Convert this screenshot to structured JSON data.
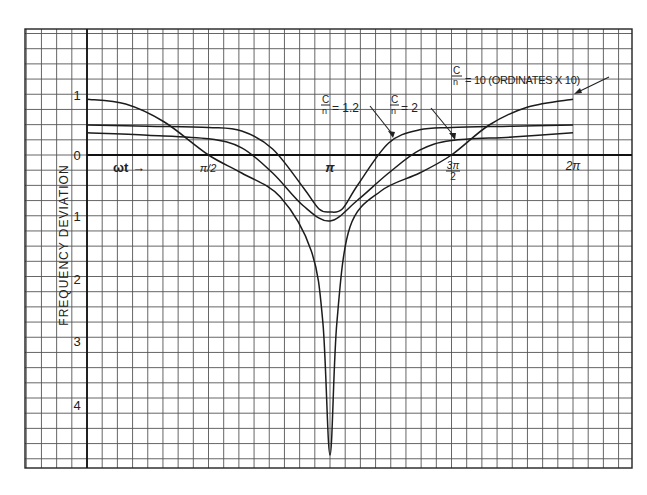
{
  "chart_data": {
    "type": "line",
    "title": "",
    "xlabel": "ωt →",
    "ylabel": "FREQUENCY DEVIATION",
    "x_ticks": [
      {
        "value": 1.5708,
        "label": "π/2"
      },
      {
        "value": 3.1416,
        "label": "π"
      },
      {
        "value": 4.7124,
        "label": "3π/2"
      },
      {
        "value": 6.2832,
        "label": "2π"
      }
    ],
    "y_ticks": [
      {
        "value": 1,
        "label": "1"
      },
      {
        "value": 0,
        "label": "0"
      },
      {
        "value": -1,
        "label": "1"
      },
      {
        "value": -2,
        "label": "2"
      },
      {
        "value": -3,
        "label": "3"
      },
      {
        "value": -4,
        "label": "4"
      }
    ],
    "xlim": [
      0,
      6.2832
    ],
    "ylim": [
      -5,
      1.5
    ],
    "grid": true,
    "series": [
      {
        "name": "C/n = 1.2",
        "x": [
          0,
          0.785,
          1.571,
          2.0,
          2.4,
          2.8,
          3.0,
          3.1416,
          3.3,
          3.5,
          3.9,
          4.3,
          4.712,
          5.5,
          6.2832
        ],
        "values": [
          0.5,
          0.48,
          0.46,
          0.4,
          0.1,
          -0.55,
          -0.9,
          -0.95,
          -0.9,
          -0.5,
          0.2,
          0.42,
          0.46,
          0.48,
          0.5
        ]
      },
      {
        "name": "C/n = 2",
        "x": [
          0,
          0.785,
          1.571,
          2.0,
          2.4,
          2.8,
          3.1416,
          3.5,
          3.9,
          4.3,
          4.712,
          5.5,
          6.2832
        ],
        "values": [
          0.37,
          0.33,
          0.27,
          0.12,
          -0.3,
          -0.85,
          -1.1,
          -0.75,
          -0.3,
          0.08,
          0.24,
          0.3,
          0.37
        ]
      },
      {
        "name": "C/n = 10 (ordinates × 10)",
        "x": [
          0,
          0.5,
          1.0,
          1.571,
          2.0,
          2.5,
          2.9,
          3.05,
          3.1416,
          3.23,
          3.4,
          3.8,
          4.3,
          4.712,
          5.2,
          5.7,
          6.2832
        ],
        "values": [
          0.93,
          0.85,
          0.55,
          0.0,
          -0.3,
          -0.7,
          -1.6,
          -2.8,
          -5.0,
          -2.8,
          -1.2,
          -0.6,
          -0.3,
          0.0,
          0.5,
          0.8,
          0.93
        ]
      }
    ],
    "annotations": [
      {
        "text_num": "C",
        "text_den": "n",
        "text_rest": "= 1.2",
        "points_to": "C/n = 1.2 curve"
      },
      {
        "text_num": "C",
        "text_den": "n",
        "text_rest": "= 2",
        "points_to": "C/n = 2 curve"
      },
      {
        "text_num": "C",
        "text_den": "n",
        "text_rest": "= 10 (ORDINATES X 10)",
        "points_to": "C/n = 10 curve"
      }
    ]
  },
  "labels": {
    "ylabel": "FREQUENCY DEVIATION",
    "xlabel": "ωt →",
    "tick_pi_half": "π/2",
    "tick_pi": "π",
    "tick_3pi_half_num": "3π",
    "tick_3pi_half_den": "2",
    "tick_2pi": "2π",
    "y1": "1",
    "y0": "0",
    "ym1": "1",
    "ym2": "2",
    "ym3": "3",
    "ym4": "4",
    "ann12_num": "C",
    "ann12_den": "n",
    "ann12_rest": "= 1.2",
    "ann2_num": "C",
    "ann2_den": "n",
    "ann2_rest": "= 2",
    "ann10_num": "C",
    "ann10_den": "n",
    "ann10_rest": "= 10 (ORDINATES X 10)"
  },
  "colors": {
    "background": "#ffffff",
    "grid": "#555555",
    "ink": "#1c1c1c"
  }
}
